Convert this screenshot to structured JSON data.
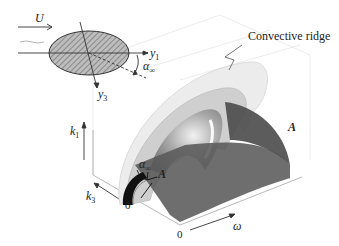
{
  "figure": {
    "annotation": "Convective ridge",
    "inset": {
      "flow_label": "U",
      "axis_y1": "y",
      "axis_y1_sub": "1",
      "axis_y3": "y",
      "axis_y3_sub": "3",
      "angle_label": "α",
      "angle_sub": "∞"
    },
    "axes": {
      "k1": "k",
      "k1_sub": "1",
      "k3": "k",
      "k3_sub": "3",
      "omega": "ω",
      "origin_k3": "0",
      "origin_omega": "0"
    },
    "surface_labels": {
      "plane_A_right": "A",
      "plane_A_front": "A",
      "angle_label": "α",
      "angle_sub": "∞"
    },
    "colors": {
      "ellipse_fill": "#b8b8b8",
      "plane": "#555555",
      "shell_outer": "#e6e6e6",
      "shell_mid": "#c8c8c8",
      "shell_inner": "#9a9a9a",
      "axis": "#333333"
    }
  }
}
